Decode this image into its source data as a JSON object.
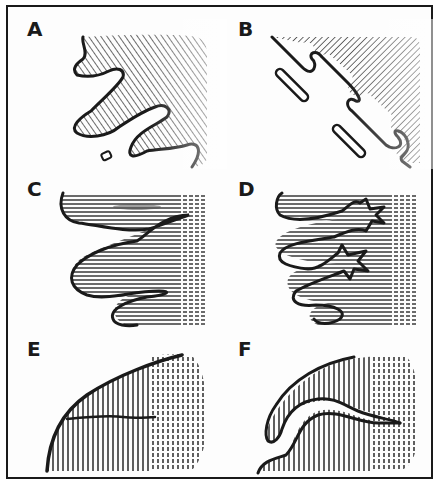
{
  "figure": {
    "panels": [
      {
        "id": "A",
        "label": "A",
        "hatch": "diagonal-right",
        "description": "Shaded region with irregular lobed boundary and a small isolated fragment"
      },
      {
        "id": "B",
        "label": "B",
        "hatch": "diagonal-left",
        "description": "Diagonal shaded band with stepped edge and detached elongated fragments"
      },
      {
        "id": "C",
        "label": "C",
        "hatch": "horizontal",
        "description": "Horizontally hatched region with three wavy lobes"
      },
      {
        "id": "D",
        "label": "D",
        "hatch": "horizontal",
        "description": "Horizontally hatched lobes separated by star-shaped indentations"
      },
      {
        "id": "E",
        "label": "E",
        "hatch": "vertical",
        "description": "Vertically hatched quarter-round region with an internal crack line"
      },
      {
        "id": "F",
        "label": "F",
        "hatch": "vertical",
        "description": "Vertically hatched arc region with a narrow curved gap"
      }
    ]
  },
  "colors": {
    "ink": "#1a1a1a",
    "paper": "#fdfdfd"
  }
}
